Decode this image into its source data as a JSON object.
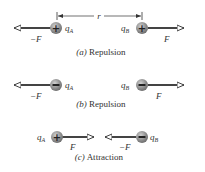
{
  "figure": {
    "distance_label": "r",
    "panels": [
      {
        "id": "a",
        "caption_letter": "(a)",
        "caption_text": "Repulsion",
        "charge_A": {
          "name": "q",
          "sub": "A",
          "sign": "+"
        },
        "charge_B": {
          "name": "q",
          "sub": "B",
          "sign": "+"
        },
        "force_on_A": "−F",
        "force_on_B": "F"
      },
      {
        "id": "b",
        "caption_letter": "(b)",
        "caption_text": "Repulsion",
        "charge_A": {
          "name": "q",
          "sub": "A",
          "sign": "−"
        },
        "charge_B": {
          "name": "q",
          "sub": "B",
          "sign": "−"
        },
        "force_on_A": "−F",
        "force_on_B": "F"
      },
      {
        "id": "c",
        "caption_letter": "(c)",
        "caption_text": "Attraction",
        "charge_A": {
          "name": "q",
          "sub": "A",
          "sign": "+"
        },
        "charge_B": {
          "name": "q",
          "sub": "B",
          "sign": "−"
        },
        "force_on_A": "F",
        "force_on_B": "−F"
      }
    ],
    "colors": {
      "arrow": "#444444",
      "sphere": "#8a8a8a",
      "sphere_highlight": "#c8c8c8",
      "text": "#333333"
    }
  }
}
